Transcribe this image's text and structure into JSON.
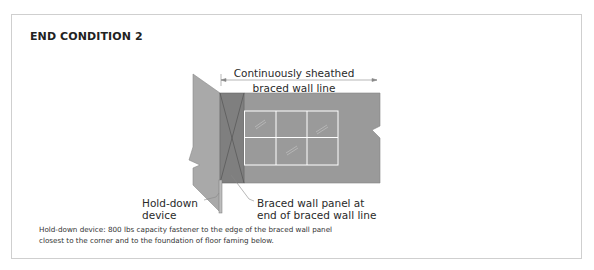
{
  "figure": {
    "title": "END CONDITION 2",
    "labels": {
      "dimension_line_1": "Continuously sheathed",
      "dimension_line_2": "braced wall line",
      "hold_down_line_1": "Hold-down",
      "hold_down_line_2": "device",
      "braced_panel_line_1": "Braced wall panel at",
      "braced_panel_line_2": "end of braced wall line"
    },
    "footnote": "Hold-down device: 800 lbs capacity fastener to the edge of the braced wall panel closest to the corner and to the foundation of floor faming below.",
    "elements": {
      "corner_wall": "corner-return-wall",
      "braced_panel": "braced-wall-panel-with-x-bracing",
      "main_wall": "continuously-sheathed-wall",
      "window": "window-2x3-panes",
      "hold_down": "hold-down-device",
      "dimension_arrow": "dimension-arrow"
    },
    "colors": {
      "frame_border": "#cfcfcf",
      "corner_wall": "#a9a9a9",
      "braced_panel": "#7f7f7f",
      "main_wall": "#9a9a9a",
      "window_frame": "#ffffff",
      "leader_line": "#888888"
    }
  }
}
